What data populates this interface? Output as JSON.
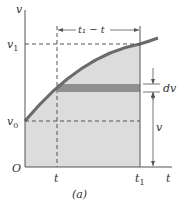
{
  "figure": {
    "caption": "(a)",
    "axes": {
      "x_label": "t",
      "y_label": "v",
      "origin_label": "O"
    },
    "x_ticks": [
      {
        "label": "t",
        "sub": ""
      },
      {
        "label": "t",
        "sub": "1"
      }
    ],
    "y_ticks": [
      {
        "label": "v",
        "sub": "1"
      },
      {
        "label": "v",
        "sub": "0"
      }
    ],
    "interval_label": "t₁ − t",
    "strip_label": "dv",
    "height_label": "v",
    "colors": {
      "curve": "#6b6b6b",
      "fill": "#d9d9d9",
      "strip": "#8a8a8a",
      "axis": "#555555"
    }
  }
}
